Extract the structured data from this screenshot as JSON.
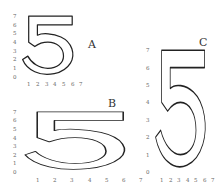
{
  "figure": {
    "panels": [
      {
        "id": "A",
        "label": "A",
        "x_ticks": [
          "1",
          "2",
          "3",
          "4",
          "5",
          "6",
          "7"
        ],
        "y_ticks": [
          "0",
          "1",
          "2",
          "3",
          "4",
          "5",
          "6",
          "7"
        ],
        "cell_w": 8.7,
        "cell_h": 8.7,
        "origin": [
          20,
          77
        ]
      },
      {
        "id": "B",
        "label": "B",
        "x_ticks": [
          "1",
          "2",
          "3",
          "4",
          "5",
          "6",
          "7"
        ],
        "y_ticks": [
          "0",
          "1",
          "2",
          "3",
          "4",
          "5",
          "6",
          "7"
        ],
        "cell_w": 17.2,
        "cell_h": 8.6,
        "origin": [
          20,
          172
        ]
      },
      {
        "id": "C",
        "label": "C",
        "x_ticks": [
          "1",
          "2",
          "3",
          "4",
          "5",
          "6",
          "7"
        ],
        "y_ticks": [
          "0",
          "1",
          "2",
          "3",
          "4",
          "5",
          "6",
          "7"
        ],
        "cell_w": 8.6,
        "cell_h": 17.4,
        "origin": [
          153,
          172
        ]
      }
    ]
  }
}
